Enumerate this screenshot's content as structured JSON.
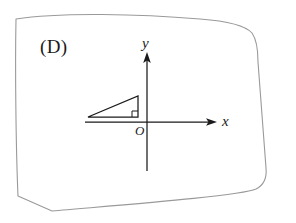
{
  "figure": {
    "choice_label": "(D)",
    "background_color": "#ffffff",
    "frame": {
      "name": "hand-drawn-border",
      "stroke_color": "#9a9a9a",
      "shape": "rounded-quadrilateral"
    },
    "axes": {
      "stroke_color": "#1a1a1a",
      "x_axis_label": "x",
      "y_axis_label": "y",
      "origin_label": "O",
      "x_axis_direction": "right",
      "y_axis_direction": "up",
      "x_axis_arrow": true,
      "y_axis_arrow": true
    },
    "shape": {
      "name": "right-triangle",
      "quadrant": "second",
      "stroke_color": "#1a1a1a",
      "right_angle_marked": true,
      "right_angle_vertex": "bottom-right",
      "vertices": [
        {
          "label": "left-vertex",
          "x": 88,
          "y": 117
        },
        {
          "label": "right-vertex",
          "x": 138,
          "y": 117
        },
        {
          "label": "apex-vertex",
          "x": 138,
          "y": 96
        }
      ],
      "base_on_x_axis": true,
      "vertical_leg_on_y_axis": true
    }
  }
}
